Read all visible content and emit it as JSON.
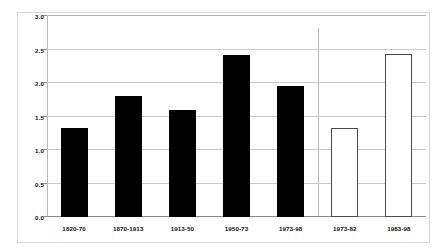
{
  "chart_data": {
    "type": "bar",
    "title": "",
    "subtitle": "",
    "xlabel": "",
    "ylabel": "",
    "ylim": [
      0.0,
      3.0
    ],
    "ytick_labels": [
      "0.0",
      "0.5",
      "1.0",
      "1.5",
      "2.0",
      "2.5",
      "3.0"
    ],
    "ytick_values": [
      0.0,
      0.5,
      1.0,
      1.5,
      2.0,
      2.5,
      3.0
    ],
    "grid": true,
    "legend": false,
    "legend_position": "none",
    "categories": [
      "1820-70",
      "1870-1913",
      "1913-50",
      "1950-73",
      "1973-98",
      "1973-82",
      "1983-98"
    ],
    "values": [
      1.33,
      1.8,
      1.6,
      2.42,
      1.95,
      1.33,
      2.43
    ],
    "bar_styles": [
      "solid",
      "solid",
      "solid",
      "solid",
      "solid",
      "outlined",
      "outlined"
    ],
    "annotations": [
      {
        "name": "group-separator",
        "type": "vertical-line",
        "after_category": "1973-98"
      }
    ],
    "colors": {
      "solid_bar": "#000000",
      "outlined_bar_fill": "#ffffff",
      "outlined_bar_stroke": "#4a4a4a",
      "gridline": "#c9c9c9",
      "axis": "#8a8a8a",
      "frame": "#d8d8d8",
      "text": "#111111"
    }
  }
}
